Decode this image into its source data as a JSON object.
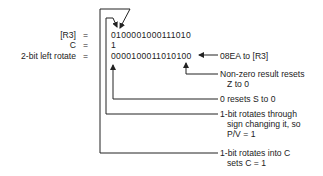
{
  "labels": {
    "r3": "[R3]",
    "c": "C",
    "rotate": "2-bit left rotate",
    "eq": "="
  },
  "values": {
    "r3": "0100001000111010",
    "c": "1",
    "result": "0000100011010100"
  },
  "annotations": {
    "result_to_r3": "08EA to [R3]",
    "zero_flag_1": "Non-zero result resets",
    "zero_flag_2": "Z to 0",
    "sign_flag": "0 resets S to 0",
    "overflow_1": "1-bit rotates through",
    "overflow_2": "sign changing it, so",
    "overflow_3": "P/V = 1",
    "carry_1": "1-bit rotates into C",
    "carry_2": "sets C = 1"
  },
  "colors": {
    "ink": "#222222"
  }
}
